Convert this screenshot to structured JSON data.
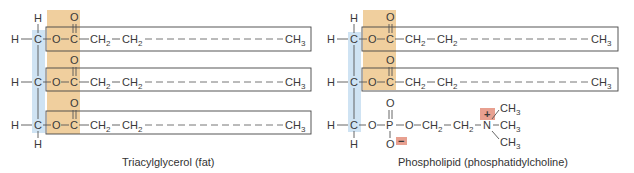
{
  "colors": {
    "glycerol_band": "#cfe3f3",
    "ester_band": "#f0cf9e",
    "charge_box": "#e8a090",
    "line": "#555555",
    "text": "#3a3a3a"
  },
  "atoms": {
    "H": "H",
    "C": "C",
    "O": "O",
    "P": "P",
    "N": "N",
    "CH": "CH",
    "sub2": "2",
    "sub3": "3",
    "plus": "+",
    "minus": "−"
  },
  "triacylglycerol": {
    "caption": "Triacylglycerol (fat)",
    "chains": [
      {
        "label": "fatty-acid-chain-1"
      },
      {
        "label": "fatty-acid-chain-2"
      },
      {
        "label": "fatty-acid-chain-3"
      }
    ]
  },
  "phospholipid": {
    "caption": "Phospholipid (phosphatidylcholine)",
    "chains": [
      {
        "label": "fatty-acid-chain-1"
      },
      {
        "label": "fatty-acid-chain-2"
      }
    ],
    "head_group": "phosphocholine"
  }
}
